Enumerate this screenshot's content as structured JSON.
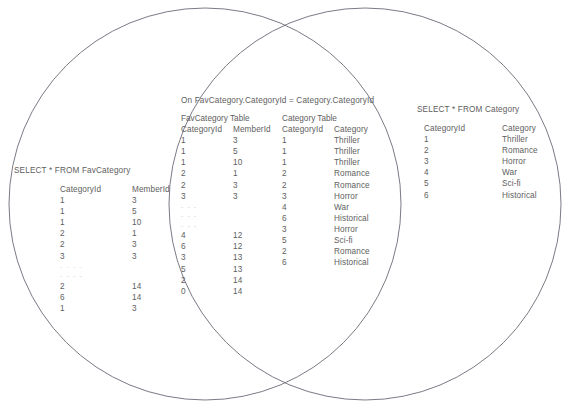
{
  "diagram": {
    "type": "venn-two-circle",
    "stroke_color": "#6b6b78",
    "text_color": "#5e5e5e",
    "background": "#ffffff",
    "left_circle": {
      "cx": 205,
      "cy": 204,
      "r": 196
    },
    "right_circle": {
      "cx": 365,
      "cy": 204,
      "r": 196
    }
  },
  "left_region": {
    "caption": "SELECT * FROM FavCategory",
    "columns": [
      "CategoryId",
      "MemberId"
    ],
    "rows_top": [
      [
        "1",
        "3"
      ],
      [
        "1",
        "5"
      ],
      [
        "1",
        "10"
      ],
      [
        "2",
        "1"
      ],
      [
        "2",
        "3"
      ],
      [
        "3",
        "3"
      ]
    ],
    "separator": "- - - -",
    "separator_2": "- - - -",
    "rows_bottom": [
      [
        "2",
        "14"
      ],
      [
        "6",
        "14"
      ],
      [
        "1",
        "3"
      ]
    ]
  },
  "middle_region": {
    "caption": "On FavCategory.CategoryId = Category.CategoryId",
    "left_table": {
      "title": "FavCategory Table",
      "columns": [
        "CategoryId",
        "MemberId"
      ],
      "rows_top": [
        [
          "1",
          "3"
        ],
        [
          "1",
          "5"
        ],
        [
          "1",
          "10"
        ],
        [
          "2",
          "1"
        ],
        [
          "2",
          "3"
        ],
        [
          "3",
          "3"
        ]
      ],
      "separators": [
        "- - -",
        "- - -",
        "- - -"
      ],
      "rows_bottom": [
        [
          "4",
          "12"
        ],
        [
          "6",
          "12"
        ],
        [
          "3",
          "13"
        ],
        [
          "5",
          "13"
        ],
        [
          "2",
          "14"
        ],
        [
          "0",
          "14"
        ]
      ]
    },
    "right_table": {
      "title": "Category Table",
      "columns": [
        "CategoryId",
        "Category"
      ],
      "rows_top": [
        [
          "1",
          "Thriller"
        ],
        [
          "1",
          "Thriller"
        ],
        [
          "1",
          "Thriller"
        ],
        [
          "2",
          "Romance"
        ],
        [
          "2",
          "Romance"
        ],
        [
          "3",
          "Horror"
        ]
      ],
      "separators": [
        "",
        "",
        ""
      ],
      "rows_bottom": [
        [
          "4",
          "War"
        ],
        [
          "6",
          "Historical"
        ],
        [
          "3",
          "Horror"
        ],
        [
          "5",
          "Sci-fi"
        ],
        [
          "2",
          "Romance"
        ],
        [
          "6",
          "Historical"
        ]
      ]
    }
  },
  "right_region": {
    "caption": "SELECT * FROM Category",
    "columns": [
      "CategoryId",
      "Category"
    ],
    "rows": [
      [
        "1",
        "Thriller"
      ],
      [
        "2",
        "Romance"
      ],
      [
        "3",
        "Horror"
      ],
      [
        "4",
        "War"
      ],
      [
        "5",
        "Sci-fi"
      ],
      [
        "6",
        "Historical"
      ]
    ]
  }
}
